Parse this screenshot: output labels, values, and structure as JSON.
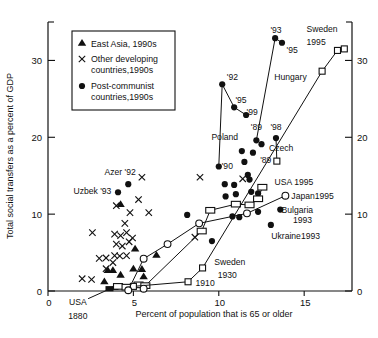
{
  "figure": {
    "background": "#ffffff",
    "ink_color": "#111111"
  },
  "chart_data": {
    "type": "scatter",
    "title": "",
    "xlabel": "Percent of population that is 65 or older",
    "ylabel": "Total social transfers as a percent of GDP",
    "xlim": [
      0,
      17.8
    ],
    "ylim": [
      0,
      35
    ],
    "xticks": [
      0,
      5,
      10,
      15
    ],
    "yticks": [
      0,
      10,
      20,
      30
    ],
    "grid": false,
    "legend_position": "upper-left-inside",
    "legend": {
      "items": [
        {
          "marker": "triangle",
          "lines": [
            "East Asia, 1990s"
          ]
        },
        {
          "marker": "cross",
          "lines": [
            "Other developing",
            "countries,1990s"
          ]
        },
        {
          "marker": "circle-filled",
          "lines": [
            "Post-communist",
            "countries,1990s"
          ]
        }
      ]
    },
    "series": [
      {
        "name": "east-asia-1990s",
        "marker": "triangle",
        "line": false,
        "points": [
          [
            4.25,
            11.3
          ],
          [
            5.1,
            5.5
          ],
          [
            6.35,
            4.7
          ],
          [
            3.5,
            2.7
          ],
          [
            3.8,
            2.7
          ],
          [
            4.25,
            2.1
          ],
          [
            5.0,
            2.9
          ],
          [
            5.5,
            2.85
          ],
          [
            5.6,
            1.9
          ],
          [
            3.3,
            1.25
          ],
          [
            3.9,
            0.5
          ]
        ]
      },
      {
        "name": "other-developing-1990s",
        "marker": "cross",
        "line": false,
        "points": [
          [
            5.5,
            14.8
          ],
          [
            8.9,
            14.8
          ],
          [
            11.4,
            14.6
          ],
          [
            5.3,
            11.9
          ],
          [
            4.0,
            11.1
          ],
          [
            4.8,
            10.2
          ],
          [
            5.9,
            10.2
          ],
          [
            4.5,
            8.8
          ],
          [
            2.6,
            7.6
          ],
          [
            3.9,
            7.4
          ],
          [
            4.25,
            7.2
          ],
          [
            4.6,
            7.6
          ],
          [
            4.95,
            6.9
          ],
          [
            4.0,
            6.1
          ],
          [
            4.35,
            5.85
          ],
          [
            4.75,
            6.4
          ],
          [
            3.0,
            4.25
          ],
          [
            3.4,
            4.3
          ],
          [
            3.9,
            4.6
          ],
          [
            4.2,
            4.55
          ],
          [
            4.6,
            4.6
          ],
          [
            3.8,
            3.7
          ],
          [
            3.4,
            2.9
          ],
          [
            2.55,
            1.5
          ],
          [
            2.0,
            1.6
          ],
          [
            8.6,
            7.0
          ]
        ]
      },
      {
        "name": "post-communist-1990s",
        "marker": "circle-filled",
        "line": false,
        "points": [
          [
            4.7,
            13.9
          ],
          [
            4.1,
            12.85
          ],
          [
            8.15,
            9.9
          ],
          [
            9.6,
            6.5
          ],
          [
            10.35,
            13.9
          ],
          [
            10.9,
            13.8
          ],
          [
            11.0,
            12.6
          ],
          [
            10.4,
            12.3
          ],
          [
            11.9,
            12.9
          ],
          [
            12.3,
            12.7
          ],
          [
            10.8,
            9.7
          ],
          [
            11.2,
            9.6
          ],
          [
            12.3,
            10.3
          ],
          [
            11.35,
            18.2
          ],
          [
            12.0,
            18.0
          ],
          [
            12.5,
            19.1
          ],
          [
            11.5,
            16.8
          ],
          [
            11.7,
            15.1
          ],
          [
            11.8,
            14.5
          ],
          [
            13.6,
            10.6
          ],
          [
            13.05,
            8.6
          ]
        ]
      },
      {
        "name": "poland-series",
        "marker": "circle-filled",
        "line": true,
        "points": [
          [
            10.0,
            16.2
          ],
          [
            10.2,
            26.9
          ],
          [
            10.9,
            23.9
          ],
          [
            11.6,
            22.9
          ]
        ]
      },
      {
        "name": "hungary-series",
        "marker": "circle-filled",
        "line": true,
        "points": [
          [
            12.2,
            19.6
          ],
          [
            13.3,
            32.9
          ],
          [
            13.7,
            32.3
          ]
        ]
      },
      {
        "name": "czech-series",
        "marker": "square",
        "line": true,
        "points": [
          [
            13.4,
            16.9
          ],
          [
            13.35,
            19.9
          ]
        ],
        "point_markers": [
          "square",
          "circle-filled"
        ]
      },
      {
        "name": "usa-series",
        "marker": "rect",
        "line": true,
        "points": [
          [
            3.6,
            0.3
          ],
          [
            4.1,
            0.6
          ],
          [
            4.6,
            0.5
          ],
          [
            5.3,
            0.8
          ],
          [
            5.7,
            0.7
          ],
          [
            9.0,
            7.8
          ],
          [
            9.5,
            10.5
          ],
          [
            11.0,
            11.3
          ],
          [
            11.8,
            11.2
          ],
          [
            12.3,
            12.0
          ],
          [
            12.55,
            13.5
          ]
        ],
        "point_markers": [
          "rect-filled",
          "rect",
          "rect",
          "rect",
          "rect",
          "rect",
          "rect",
          "rect",
          "rect",
          "rect",
          "rect"
        ]
      },
      {
        "name": "sweden-series",
        "marker": "square",
        "line": true,
        "points": [
          [
            5.0,
            0.6
          ],
          [
            8.2,
            1.2
          ],
          [
            9.05,
            3.0
          ],
          [
            16.05,
            28.6
          ],
          [
            16.95,
            31.3
          ],
          [
            17.35,
            31.5
          ]
        ]
      },
      {
        "name": "japan-series",
        "marker": "circle-open",
        "line": true,
        "points": [
          [
            4.7,
            0.1
          ],
          [
            5.6,
            4.2
          ],
          [
            7.0,
            6.1
          ],
          [
            8.85,
            8.8
          ],
          [
            11.65,
            10.1
          ],
          [
            13.9,
            12.4
          ]
        ]
      },
      {
        "name": "japan-extra-point",
        "marker": "circle-open",
        "line": false,
        "points": [
          [
            5.6,
            0.3
          ]
        ]
      }
    ],
    "annotations": [
      {
        "text": "Azer '92",
        "x": 4.22,
        "y": 15.5,
        "anchor": "middle"
      },
      {
        "text": "Uzbek '93",
        "x": 2.6,
        "y": 13.0,
        "anchor": "middle"
      },
      {
        "text": "'92",
        "x": 10.8,
        "y": 27.9,
        "anchor": "middle"
      },
      {
        "text": "'95",
        "x": 11.3,
        "y": 24.9,
        "anchor": "middle"
      },
      {
        "text": "'99",
        "x": 11.95,
        "y": 23.3,
        "anchor": "middle"
      },
      {
        "text": "'89",
        "x": 12.2,
        "y": 21.3,
        "anchor": "middle"
      },
      {
        "text": "'98",
        "x": 13.35,
        "y": 21.3,
        "anchor": "middle"
      },
      {
        "text": "Poland",
        "x": 10.35,
        "y": 20.0,
        "anchor": "middle"
      },
      {
        "text": "Czech",
        "x": 13.65,
        "y": 18.6,
        "anchor": "middle"
      },
      {
        "text": "'89",
        "x": 12.75,
        "y": 17.1,
        "anchor": "middle"
      },
      {
        "text": "'90",
        "x": 10.5,
        "y": 16.2,
        "anchor": "middle"
      },
      {
        "text": "'93",
        "x": 13.35,
        "y": 34.0,
        "anchor": "middle"
      },
      {
        "text": "'95",
        "x": 14.3,
        "y": 31.3,
        "anchor": "middle"
      },
      {
        "text": "Sweden",
        "x": 16.05,
        "y": 34.1,
        "anchor": "middle"
      },
      {
        "text": "1995",
        "x": 15.7,
        "y": 32.4,
        "anchor": "middle"
      },
      {
        "text": "Hungary",
        "x": 14.2,
        "y": 27.9,
        "anchor": "middle"
      },
      {
        "text": "USA 1995",
        "x": 14.4,
        "y": 14.2,
        "anchor": "middle"
      },
      {
        "text": "Japan1995",
        "x": 14.25,
        "y": 12.4,
        "anchor": "start"
      },
      {
        "text": "Bulgaria",
        "x": 14.6,
        "y": 10.6,
        "anchor": "middle"
      },
      {
        "text": "1993",
        "x": 14.9,
        "y": 9.3,
        "anchor": "middle"
      },
      {
        "text": "Ukraine1993",
        "x": 14.5,
        "y": 7.1,
        "anchor": "middle"
      },
      {
        "text": "Sweden",
        "x": 10.65,
        "y": 3.8,
        "anchor": "middle"
      },
      {
        "text": "1930",
        "x": 10.5,
        "y": 2.1,
        "anchor": "middle"
      },
      {
        "text": "1910",
        "x": 9.2,
        "y": 1.0,
        "anchor": "middle"
      },
      {
        "text": "USA",
        "x": 1.75,
        "y": -1.4,
        "anchor": "middle"
      },
      {
        "text": "1880",
        "x": 1.75,
        "y": -3.3,
        "anchor": "middle"
      }
    ],
    "pointer_lines": [
      {
        "x1": 2.35,
        "y1": -1.0,
        "x2": 3.55,
        "y2": 0.2
      }
    ]
  }
}
